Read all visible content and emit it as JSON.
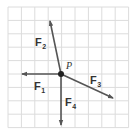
{
  "diagram": {
    "type": "force-vector-diagram",
    "grid": {
      "x0": 8,
      "y0": 7,
      "spacing": 13.4,
      "cols": 9,
      "rows": 9,
      "line_color": "#dcdcdc"
    },
    "arrow_color": "#555555",
    "point": {
      "label": "P",
      "x": 61,
      "y": 74
    },
    "forces": [
      {
        "id": "F1",
        "main": "F",
        "sub": "1",
        "tip": [
          22,
          74
        ],
        "label_pos": [
          34,
          90
        ]
      },
      {
        "id": "F2",
        "main": "F",
        "sub": "2",
        "tip": [
          50,
          21
        ],
        "label_pos": [
          35,
          46
        ]
      },
      {
        "id": "F3",
        "main": "F",
        "sub": "3",
        "tip": [
          113,
          98
        ],
        "label_pos": [
          90,
          84
        ]
      },
      {
        "id": "F4",
        "main": "F",
        "sub": "4",
        "tip": [
          61,
          125
        ],
        "label_pos": [
          65,
          106
        ]
      }
    ]
  }
}
